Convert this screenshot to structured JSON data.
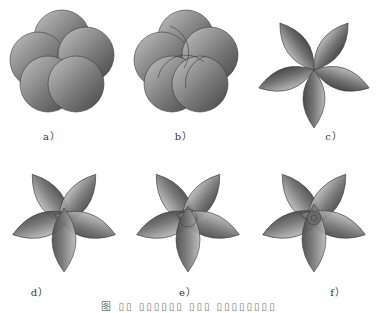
{
  "figure": {
    "panels": [
      {
        "id": "a",
        "label": "a）",
        "shape": "overlapping-circles",
        "count": 5
      },
      {
        "id": "b",
        "label": "b）",
        "shape": "overlapping-circles-with-inner-arcs",
        "count": 5
      },
      {
        "id": "c",
        "label": "c）",
        "shape": "five-lens-petals",
        "count": 5
      },
      {
        "id": "d",
        "label": "d）",
        "shape": "five-lens-petals-overlapping-center",
        "count": 5
      },
      {
        "id": "e",
        "label": "e）",
        "shape": "five-lens-petals-with-center-arcs",
        "count": 5
      },
      {
        "id": "f",
        "label": "f）",
        "shape": "five-lens-petals-with-center-knot",
        "count": 5
      }
    ],
    "caption": "图 ▯▯ ▯▯▯▯▯▯ ▯▯▯ ▯▯▯▯▯▯▯▯",
    "colors": {
      "fill_dark": "#4a4a4a",
      "fill_light": "#b5b5b5",
      "stroke": "#3a3a3a"
    }
  }
}
